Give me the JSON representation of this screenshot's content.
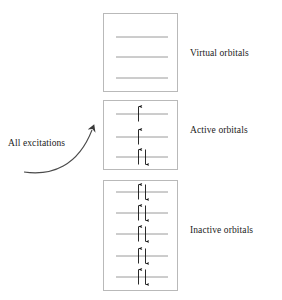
{
  "figure": {
    "type": "orbital-energy-level-diagram",
    "background_color": "#ffffff",
    "box_border_color": "#b9b9b9",
    "orbital_line_color": "#9a9a9a",
    "arrow_color": "#121212",
    "text_color": "#1b1b1b"
  },
  "excitation": {
    "label": "All excitations",
    "arrow_name": "curved-arrow-up-right"
  },
  "groups": [
    {
      "id": "virtual",
      "label": "Virtual orbitals",
      "box": {
        "x": 103,
        "y": 13,
        "width": 75,
        "height": 79
      },
      "label_position": {
        "x": 190,
        "y": 48
      },
      "orbital_lines": [
        {
          "y": 37,
          "x1": 116,
          "x2": 168,
          "electrons": []
        },
        {
          "y": 57,
          "x1": 116,
          "x2": 168,
          "electrons": []
        },
        {
          "y": 78,
          "x1": 116,
          "x2": 168,
          "electrons": []
        }
      ]
    },
    {
      "id": "active",
      "label": "Active orbitals",
      "box": {
        "x": 103,
        "y": 100,
        "width": 75,
        "height": 70
      },
      "label_position": {
        "x": 190,
        "y": 125
      },
      "orbital_lines": [
        {
          "y": 114,
          "x1": 116,
          "x2": 168,
          "electrons": [
            "up"
          ]
        },
        {
          "y": 137,
          "x1": 116,
          "x2": 168,
          "electrons": [
            "up"
          ]
        },
        {
          "y": 157,
          "x1": 116,
          "x2": 168,
          "electrons": [
            "up",
            "down"
          ]
        }
      ]
    },
    {
      "id": "inactive",
      "label": "Inactive orbitals",
      "box": {
        "x": 103,
        "y": 180,
        "width": 75,
        "height": 111
      },
      "label_position": {
        "x": 190,
        "y": 225
      },
      "orbital_lines": [
        {
          "y": 192,
          "x1": 116,
          "x2": 168,
          "electrons": [
            "up",
            "down"
          ]
        },
        {
          "y": 213,
          "x1": 116,
          "x2": 168,
          "electrons": [
            "up",
            "down"
          ]
        },
        {
          "y": 234,
          "x1": 116,
          "x2": 168,
          "electrons": [
            "up",
            "down"
          ]
        },
        {
          "y": 256,
          "x1": 116,
          "x2": 168,
          "electrons": [
            "up",
            "down"
          ]
        },
        {
          "y": 277,
          "x1": 116,
          "x2": 168,
          "electrons": [
            "up",
            "down"
          ]
        }
      ]
    }
  ],
  "corner_mark": {
    "text": ""
  }
}
